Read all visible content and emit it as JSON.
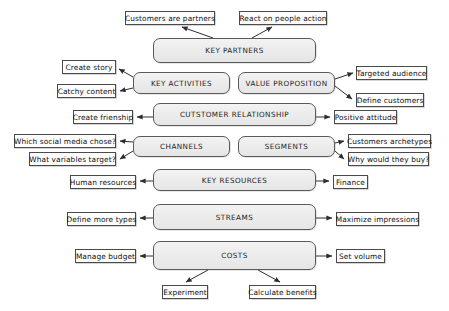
{
  "diagram": {
    "canvas": {
      "width": 449,
      "height": 311,
      "background": "#ffffff"
    },
    "style": {
      "main_box_fill": "#ececec",
      "main_box_stroke": "#5a5a5a",
      "note_box_fill": "#fdfdfd",
      "note_box_stroke": "#4a4a4a",
      "connector_color": "#3a3a3a"
    },
    "main_blocks": [
      {
        "id": "key-partners",
        "label": "KEY PARTNERS",
        "x": 153,
        "y": 38,
        "w": 163,
        "h": 25
      },
      {
        "id": "key-activities",
        "label": "KEY ACTIVITIES",
        "x": 133,
        "y": 72,
        "w": 97,
        "h": 22
      },
      {
        "id": "value-proposition",
        "label": "VALUE PROPOSITION",
        "x": 238,
        "y": 72,
        "w": 97,
        "h": 22
      },
      {
        "id": "customer-relationship",
        "label": "CUTSTOMER RELATIONSHIP",
        "x": 153,
        "y": 103,
        "w": 163,
        "h": 23
      },
      {
        "id": "channels",
        "label": "CHANNELS",
        "x": 133,
        "y": 136,
        "w": 97,
        "h": 21
      },
      {
        "id": "segments",
        "label": "SEGMENTS",
        "x": 238,
        "y": 136,
        "w": 97,
        "h": 21
      },
      {
        "id": "key-resources",
        "label": "KEY RESOURCES",
        "x": 153,
        "y": 169,
        "w": 163,
        "h": 22
      },
      {
        "id": "streams",
        "label": "STREAMS",
        "x": 153,
        "y": 204,
        "w": 163,
        "h": 26
      },
      {
        "id": "costs",
        "label": "COSTS",
        "x": 153,
        "y": 241,
        "w": 163,
        "h": 29
      }
    ],
    "note_blocks": [
      {
        "id": "customers-are-partners",
        "label": "Customers are partners",
        "x": 125,
        "y": 11,
        "w": 90,
        "h": 14
      },
      {
        "id": "react-on-people-action",
        "label": "React on people action",
        "x": 239,
        "y": 11,
        "w": 88,
        "h": 14
      },
      {
        "id": "create-story",
        "label": "Create story",
        "x": 62,
        "y": 60,
        "w": 54,
        "h": 14
      },
      {
        "id": "catchy-content",
        "label": "Catchy content",
        "x": 57,
        "y": 84,
        "w": 59,
        "h": 14
      },
      {
        "id": "targeted-audience",
        "label": "Targeted audience",
        "x": 356,
        "y": 66,
        "w": 71,
        "h": 14
      },
      {
        "id": "define-customers",
        "label": "Define customers",
        "x": 356,
        "y": 93,
        "w": 68,
        "h": 14
      },
      {
        "id": "create-frienship",
        "label": "Create frienship",
        "x": 73,
        "y": 110,
        "w": 60,
        "h": 14
      },
      {
        "id": "positive-attitude",
        "label": "Positive attitude",
        "x": 334,
        "y": 110,
        "w": 63,
        "h": 14
      },
      {
        "id": "which-social-media-chose",
        "label": "Which social media chose?",
        "x": 14,
        "y": 134,
        "w": 102,
        "h": 14
      },
      {
        "id": "what-variables-target",
        "label": "What variables target?",
        "x": 29,
        "y": 152,
        "w": 87,
        "h": 14
      },
      {
        "id": "customers-archetypes",
        "label": "Customers archetypes",
        "x": 348,
        "y": 134,
        "w": 83,
        "h": 14
      },
      {
        "id": "why-would-they-buy",
        "label": "Why would they buy?",
        "x": 348,
        "y": 152,
        "w": 81,
        "h": 14
      },
      {
        "id": "human-resources",
        "label": "Human resources",
        "x": 70,
        "y": 175,
        "w": 66,
        "h": 14
      },
      {
        "id": "finance",
        "label": "Finance",
        "x": 333,
        "y": 175,
        "w": 35,
        "h": 14
      },
      {
        "id": "define-more-types",
        "label": "Define more types",
        "x": 67,
        "y": 212,
        "w": 69,
        "h": 14
      },
      {
        "id": "maximize-impressions",
        "label": "Maximize impressions",
        "x": 336,
        "y": 212,
        "w": 83,
        "h": 14
      },
      {
        "id": "manage-budget",
        "label": "Manage budget",
        "x": 75,
        "y": 249,
        "w": 61,
        "h": 14
      },
      {
        "id": "set-volume",
        "label": "Set volume",
        "x": 336,
        "y": 249,
        "w": 49,
        "h": 14
      },
      {
        "id": "experiment",
        "label": "Experiment",
        "x": 162,
        "y": 285,
        "w": 46,
        "h": 14
      },
      {
        "id": "calculate-benefits",
        "label": "Calculate benefits",
        "x": 249,
        "y": 285,
        "w": 67,
        "h": 14
      }
    ],
    "connectors": [
      {
        "from": "key-partners",
        "to": "customers-are-partners",
        "path": "M 213 38 L 182 27"
      },
      {
        "from": "key-partners",
        "to": "react-on-people-action",
        "path": "M 252 38 L 272 27"
      },
      {
        "from": "key-activities",
        "to": "create-story",
        "path": "M 133 77 L 119 69"
      },
      {
        "from": "key-activities",
        "to": "catchy-content",
        "path": "M 133 88 L 120 91"
      },
      {
        "from": "value-proposition",
        "to": "targeted-audience",
        "path": "M 335 79 L 353 73"
      },
      {
        "from": "value-proposition",
        "to": "define-customers",
        "path": "M 335 86 L 352 99"
      },
      {
        "from": "customer-relationship",
        "to": "create-frienship",
        "path": "M 153 117 L 137 117"
      },
      {
        "from": "customer-relationship",
        "to": "positive-attitude",
        "path": "M 316 117 L 330 117"
      },
      {
        "from": "channels",
        "to": "which-social-media-chose",
        "path": "M 133 142 L 120 141"
      },
      {
        "from": "channels",
        "to": "what-variables-target",
        "path": "M 133 151 L 120 159"
      },
      {
        "from": "segments",
        "to": "customers-archetypes",
        "path": "M 335 143 L 344 141"
      },
      {
        "from": "segments",
        "to": "why-would-they-buy",
        "path": "M 335 151 L 344 159"
      },
      {
        "from": "key-resources",
        "to": "human-resources",
        "path": "M 153 181 L 140 181"
      },
      {
        "from": "key-resources",
        "to": "finance",
        "path": "M 316 181 L 329 181"
      },
      {
        "from": "streams",
        "to": "define-more-types",
        "path": "M 153 218 L 140 218"
      },
      {
        "from": "streams",
        "to": "maximize-impressions",
        "path": "M 316 218 L 332 218"
      },
      {
        "from": "costs",
        "to": "manage-budget",
        "path": "M 153 256 L 140 256"
      },
      {
        "from": "costs",
        "to": "set-volume",
        "path": "M 316 256 L 332 256"
      },
      {
        "from": "costs",
        "to": "experiment",
        "path": "M 208 270 L 186 282"
      },
      {
        "from": "costs",
        "to": "calculate-benefits",
        "path": "M 258 270 L 280 282"
      }
    ]
  }
}
